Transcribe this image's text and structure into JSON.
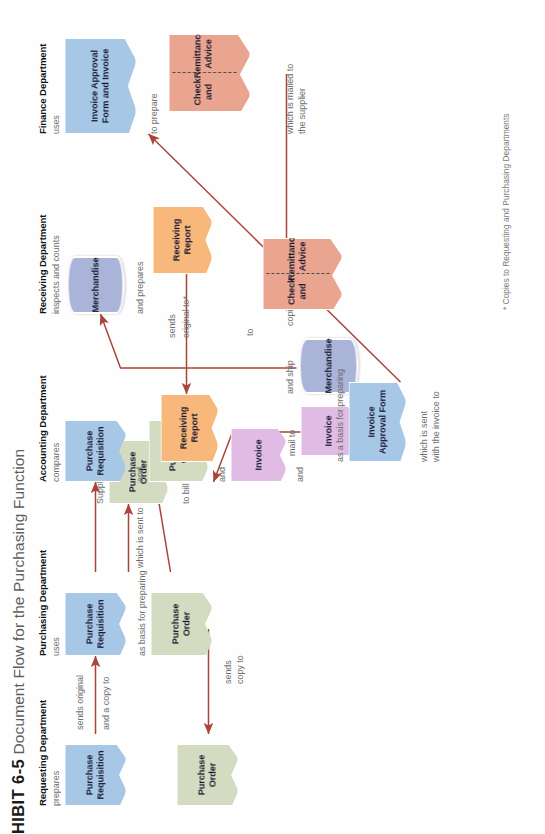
{
  "exhibit": {
    "number_label": "EXHIBIT 6-5",
    "visible_number_label": "HIBIT 6-5",
    "title": "Document Flow for the Purchasing Function"
  },
  "footnote": "* Copies to Requesting and Purchasing Departments",
  "colors": {
    "blue": "#a7c7e7",
    "green": "#d3dcc0",
    "purple": "#e0bbe4",
    "orange": "#f8b87c",
    "salmon": "#eaa591",
    "periwinkle": "#aab4d8",
    "arrow": "#a8453b",
    "label_text": "#6f6f6f",
    "header_text": "#111111"
  },
  "lanes": [
    {
      "id": "requesting",
      "header": "Requesting Department"
    },
    {
      "id": "purchasing",
      "header": "Purchasing Department"
    },
    {
      "id": "accounting",
      "header": "Accounting Department"
    },
    {
      "id": "receiving",
      "header": "Receiving Department"
    },
    {
      "id": "finance",
      "header": "Finance Department"
    }
  ],
  "documents": [
    {
      "id": "req-pr",
      "lane": "requesting",
      "label": "Purchase Requisition",
      "color": "blue",
      "shape": "sheet"
    },
    {
      "id": "req-po",
      "lane": "requesting",
      "label": "Purchase Order",
      "color": "green",
      "shape": "sheet"
    },
    {
      "id": "pur-pr",
      "lane": "purchasing",
      "label": "Purchase Requisition",
      "color": "blue",
      "shape": "sheet"
    },
    {
      "id": "pur-po",
      "lane": "purchasing",
      "label": "Purchase Order",
      "color": "green",
      "shape": "sheet"
    },
    {
      "id": "sup-po",
      "lane": "supplier",
      "label": "Purchase Order",
      "color": "green",
      "shape": "sheet"
    },
    {
      "id": "sup-inv",
      "lane": "supplier",
      "label": "Invoice",
      "color": "purple",
      "shape": "sheet"
    },
    {
      "id": "sup-merch",
      "lane": "supplier",
      "label": "Merchandise",
      "color": "periwinkle",
      "shape": "pill"
    },
    {
      "id": "sup-check",
      "lane": "supplier",
      "label_line1": "Check and",
      "label_line2": "Remittance Advice",
      "color": "salmon",
      "shape": "split"
    },
    {
      "id": "acc-pr",
      "lane": "accounting",
      "label": "Purchase Requisition",
      "color": "blue",
      "shape": "sheet"
    },
    {
      "id": "acc-po",
      "lane": "accounting",
      "label": "Purchase Order",
      "color": "green",
      "shape": "sheet"
    },
    {
      "id": "acc-inv",
      "lane": "accounting",
      "label": "Invoice",
      "color": "purple",
      "shape": "sheet"
    },
    {
      "id": "acc-rr",
      "lane": "accounting",
      "label": "Receiving Report",
      "color": "orange",
      "shape": "sheet"
    },
    {
      "id": "acc-iaf",
      "lane": "accounting",
      "label": "Invoice Approval Form",
      "color": "blue",
      "shape": "sheet"
    },
    {
      "id": "rec-merch",
      "lane": "receiving",
      "label": "Merchandise",
      "color": "periwinkle",
      "shape": "pill"
    },
    {
      "id": "rec-rr",
      "lane": "receiving",
      "label": "Receiving Report",
      "color": "orange",
      "shape": "sheet"
    },
    {
      "id": "fin-iafi",
      "lane": "finance",
      "label": "Invoice Approval Form and Invoice",
      "color": "blue",
      "shape": "sheet"
    },
    {
      "id": "fin-check",
      "lane": "finance",
      "label_line1": "Check and",
      "label_line2": "Remittance Advice",
      "color": "salmon",
      "shape": "split"
    }
  ],
  "flow_labels": {
    "req_prepares": "prepares",
    "req_sends_original": "sends original",
    "req_and_copy": "and a copy to",
    "pur_uses": "uses",
    "pur_as_basis": "as basis for preparing",
    "pur_which_sent": "which is sent to",
    "pur_sends": "sends",
    "pur_copy_to": "copy to",
    "req_sends": "sends",
    "req_copy_to": "copy to",
    "sup_uses_the": "Supplier uses the",
    "sup_to_bill": "to bill customer",
    "sup_mail_to": "mail to",
    "sup_and_ship": "and ship",
    "sup_to": "to",
    "sup_copies_of": "copies of",
    "acc_compares": "compares",
    "acc_and_1": "and",
    "acc_and_2": "and",
    "acc_and_3": "and",
    "acc_as_basis": "as a basis for preparing",
    "acc_which_sent": "which is sent",
    "acc_with_invoice": "with the invoice to",
    "rec_inspects": "inspects and counts",
    "rec_and_prepares": "and prepares",
    "rec_sends": "sends",
    "rec_original_to": "original to*",
    "fin_uses": "uses",
    "fin_to_prepare": "to prepare",
    "fin_which_mailed": "which is mailed to",
    "fin_the_supplier": "the supplier"
  }
}
